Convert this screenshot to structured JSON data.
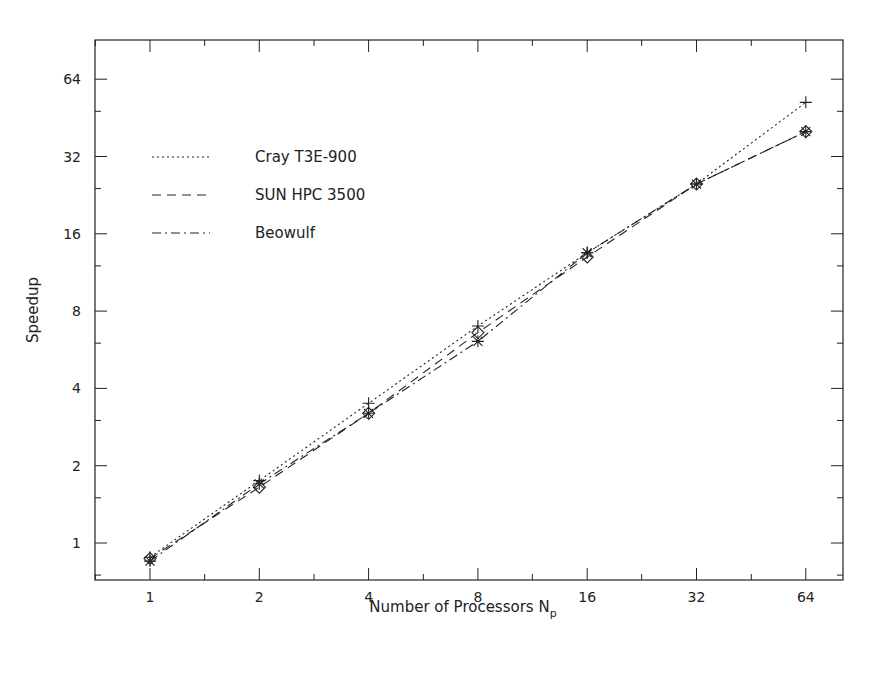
{
  "chart_data": {
    "type": "line",
    "title": "",
    "xlabel": "Number of Processors N",
    "xlabel_subscript": "p",
    "ylabel": "Speedup",
    "x_scale": "log2",
    "y_scale": "log2",
    "x": [
      1,
      2,
      4,
      8,
      16,
      32,
      64
    ],
    "x_tick_labels": [
      "1",
      "2",
      "4",
      "8",
      "16",
      "32",
      "64"
    ],
    "y_ticks": [
      1,
      2,
      4,
      8,
      16,
      32,
      64
    ],
    "y_tick_labels": [
      "1",
      "2",
      "4",
      "8",
      "16",
      "32",
      "64"
    ],
    "xlim": [
      0.7,
      100
    ],
    "ylim": [
      0.75,
      90
    ],
    "grid": false,
    "legend_position": "upper-left",
    "series": [
      {
        "name": "Cray T3E-900",
        "line_style": "dotted",
        "marker": "plus",
        "values": [
          0.88,
          1.75,
          3.5,
          7.0,
          13.5,
          25,
          52
        ]
      },
      {
        "name": "SUN HPC 3500",
        "line_style": "dashed",
        "marker": "diamond",
        "values": [
          0.87,
          1.65,
          3.2,
          6.6,
          13,
          25,
          40
        ]
      },
      {
        "name": "Beowulf",
        "line_style": "dash-dot",
        "marker": "asterisk",
        "values": [
          0.85,
          1.7,
          3.2,
          6.1,
          13.5,
          25,
          40
        ]
      }
    ]
  }
}
